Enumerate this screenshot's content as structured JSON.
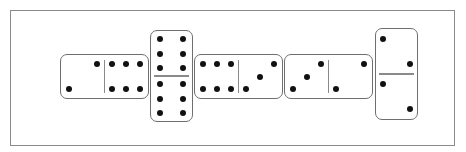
{
  "board": {
    "frame": {
      "border_color": "#8a8a8a"
    },
    "pip_color": "#111111",
    "domino_border_color": "#6f6f6f",
    "dominoes": [
      {
        "id": "d1",
        "orientation": "horizontal",
        "left": 60,
        "top": 54,
        "values": [
          2,
          6
        ]
      },
      {
        "id": "d2",
        "orientation": "vertical",
        "left": 150,
        "top": 30,
        "values": [
          6,
          6
        ]
      },
      {
        "id": "d3",
        "orientation": "horizontal",
        "left": 194,
        "top": 54,
        "values": [
          6,
          3
        ]
      },
      {
        "id": "d4",
        "orientation": "horizontal",
        "left": 284,
        "top": 54,
        "values": [
          3,
          2
        ]
      },
      {
        "id": "d5",
        "orientation": "vertical",
        "left": 375,
        "top": 28,
        "values": [
          2,
          2
        ]
      }
    ]
  }
}
